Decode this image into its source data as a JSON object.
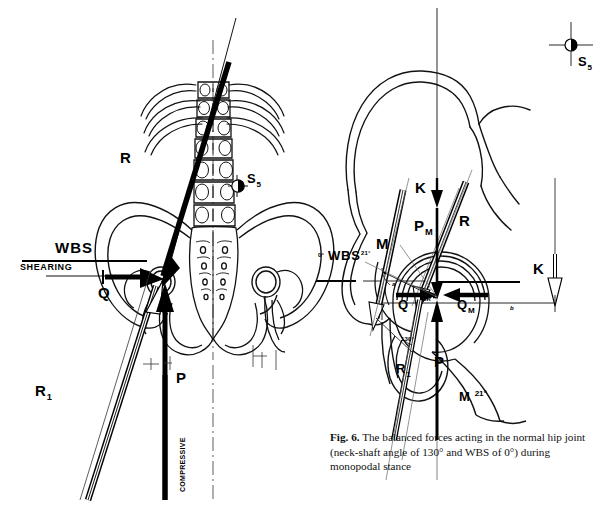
{
  "figure": {
    "number": "Fig. 6.",
    "caption_text": "The balanced forces acting in the normal hip joint (neck-shaft angle of 130° and WBS of 0°) during monopodal stance"
  },
  "left_panel": {
    "name": "bipodal-pelvis-force-diagram",
    "labels": {
      "resultant": "R",
      "sacral_point": "S",
      "sacral_point_sub": "5",
      "wbs": "WBS",
      "shearing": "SHEARING",
      "shear_force": "Q",
      "reaction": "R",
      "reaction_sub": "1",
      "compressive_force": "P",
      "compressive_axis": "COMPRESSIVE"
    }
  },
  "right_panel": {
    "name": "monopodal-hip-joint-force-diagram",
    "labels": {
      "sacral_point": "S",
      "sacral_point_sub": "5",
      "body_weight_top": "K",
      "body_weight_right": "K",
      "partial_body_weight": "P",
      "partial_body_weight_sub": "M",
      "resultant": "R",
      "abductor_muscle": "M",
      "abductor_muscle_bottom": "M",
      "abductor_angle": "21°",
      "wbs_left_angle": "0°",
      "wbs": "WBS",
      "wbs_right_angle": "21°",
      "shear_force": "Q",
      "shear_force_muscle": "Q",
      "shear_force_muscle_sub": "M",
      "center_of_rotation": "CR",
      "reaction": "R",
      "reaction_sub": "1",
      "compressive_force": "P",
      "neck_shaft_angle": "130°",
      "lever_arm_a": "a",
      "lever_arm_b": "b"
    }
  },
  "colors": {
    "ink": "#000000",
    "outline": "#1a1a1a",
    "hollow_fill": "#ffffff",
    "paper": "#ffffff",
    "caption_text": "#111111"
  }
}
